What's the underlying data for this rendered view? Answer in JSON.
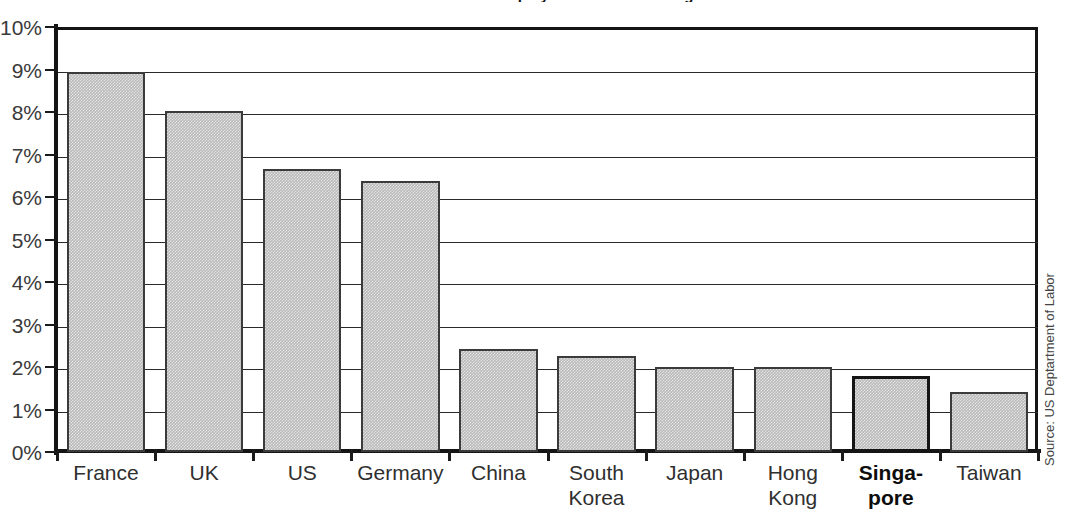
{
  "chart_data": {
    "type": "bar",
    "title": "Percent of Workforce Employed in Manufacturing",
    "categories": [
      "France",
      "UK",
      "US",
      "Germany",
      "China",
      "South\nKorea",
      "Japan",
      "Hong\nKong",
      "Singa-\npore",
      "Taiwan"
    ],
    "values": [
      8.95,
      8.03,
      6.65,
      6.37,
      2.42,
      2.25,
      2.0,
      2.0,
      1.8,
      1.42
    ],
    "highlight_index": 8,
    "xlabel": "",
    "ylabel": "",
    "ylim": [
      0,
      10
    ],
    "ytick_step": 1,
    "ytick_labels": [
      "10%",
      "9%",
      "8%",
      "7%",
      "6%",
      "5%",
      "4%",
      "3%",
      "2%",
      "1%",
      "0%"
    ],
    "ytick_values": [
      10,
      9,
      8,
      7,
      6,
      5,
      4,
      3,
      2,
      1,
      0
    ],
    "grid": true,
    "grid_axis": "y",
    "legend": false,
    "legend_position": "none",
    "source_note": "Source: US Deptartment of Labor",
    "bar_fill_color": "#b9b9b9",
    "bar_border_color": "#3b3b3b",
    "highlight_border_color": "#151515",
    "axis_color": "#141414",
    "grid_color": "#2a2a2a",
    "label_color": "#2f2f2f",
    "background_color": "#ffffff"
  }
}
